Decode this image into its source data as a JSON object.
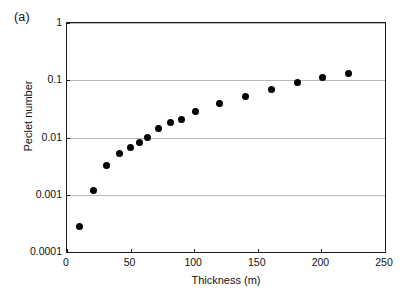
{
  "figure": {
    "panel_label": "(a)"
  },
  "chart_data": {
    "type": "scatter",
    "title": "",
    "xlabel": "Thickness (m)",
    "ylabel": "Peclet number",
    "xlim": [
      0,
      250
    ],
    "ylim": [
      0.0001,
      1
    ],
    "yscale": "log",
    "xscale": "linear",
    "grid": "horizontal",
    "legend": "none",
    "xticks": [
      0,
      50,
      100,
      150,
      200,
      250
    ],
    "xtick_labels": [
      "0",
      "50",
      "100",
      "150",
      "200",
      "250"
    ],
    "yticks": [
      0.0001,
      0.001,
      0.01,
      0.1,
      1
    ],
    "ytick_labels": [
      "0.0001",
      "0.001",
      "0.01",
      "0.1",
      "1"
    ],
    "marker": "filled-circle",
    "marker_color": "#000000",
    "points": [
      {
        "x": 10,
        "y": 0.00028
      },
      {
        "x": 21,
        "y": 0.0012
      },
      {
        "x": 31,
        "y": 0.0032
      },
      {
        "x": 41,
        "y": 0.0052
      },
      {
        "x": 50,
        "y": 0.0068
      },
      {
        "x": 57,
        "y": 0.0082
      },
      {
        "x": 63,
        "y": 0.0102
      },
      {
        "x": 72,
        "y": 0.0145
      },
      {
        "x": 81,
        "y": 0.018
      },
      {
        "x": 90,
        "y": 0.0205
      },
      {
        "x": 101,
        "y": 0.0285
      },
      {
        "x": 120,
        "y": 0.04
      },
      {
        "x": 140,
        "y": 0.052
      },
      {
        "x": 161,
        "y": 0.068
      },
      {
        "x": 181,
        "y": 0.09
      },
      {
        "x": 201,
        "y": 0.11
      },
      {
        "x": 221,
        "y": 0.13
      }
    ]
  }
}
